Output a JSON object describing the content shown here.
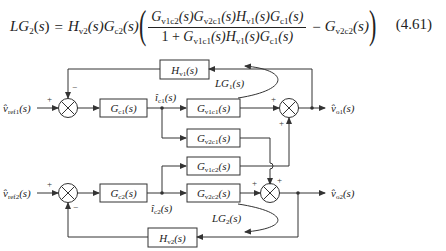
{
  "equation": {
    "number": "(4.61)",
    "lhs": "LG2(s)",
    "lhs_base": "LG",
    "lhs_sub": "2",
    "prefix": [
      {
        "base": "H",
        "sub": "v2",
        "arg": "(s)"
      },
      {
        "base": "G",
        "sub": "c2",
        "arg": "(s)"
      }
    ],
    "numerator": [
      {
        "base": "G",
        "sub": "v1c2",
        "arg": "(s)"
      },
      {
        "base": "G",
        "sub": "v2c1",
        "arg": "(s)"
      },
      {
        "base": "H",
        "sub": "v1",
        "arg": "(s)"
      },
      {
        "base": "G",
        "sub": "c1",
        "arg": "(s)"
      }
    ],
    "denominator_prefix": "1 + ",
    "denominator": [
      {
        "base": "G",
        "sub": "v1c1",
        "arg": "(s)"
      },
      {
        "base": "H",
        "sub": "v1",
        "arg": "(s)"
      },
      {
        "base": "G",
        "sub": "c1",
        "arg": "(s)"
      }
    ],
    "minus_term": {
      "base": "G",
      "sub": "v2c2",
      "arg": "(s)"
    },
    "equals": "=",
    "minus": "−"
  },
  "diagram": {
    "blocks": {
      "Hv1": {
        "base": "H",
        "sub": "v1",
        "arg": "(s)"
      },
      "Gc1": {
        "base": "G",
        "sub": "c1",
        "arg": "(s)"
      },
      "Gv1c1": {
        "base": "G",
        "sub": "v1c1",
        "arg": "(s)"
      },
      "Gv2c1": {
        "base": "G",
        "sub": "v2c1",
        "arg": "(s)"
      },
      "Gv1c2": {
        "base": "G",
        "sub": "v1c2",
        "arg": "(s)"
      },
      "Gv2c2": {
        "base": "G",
        "sub": "v2c2",
        "arg": "(s)"
      },
      "Gc2": {
        "base": "G",
        "sub": "c2",
        "arg": "(s)"
      },
      "Hv2": {
        "base": "H",
        "sub": "v2",
        "arg": "(s)"
      }
    },
    "signals": {
      "vref1": {
        "base": "v̂",
        "sub": "ref1",
        "arg": "(s)"
      },
      "vref2": {
        "base": "v̂",
        "sub": "ref2",
        "arg": "(s)"
      },
      "ic1": {
        "base": "î",
        "sub": "c1",
        "arg": "(s)"
      },
      "ic2": {
        "base": "î",
        "sub": "c2",
        "arg": "(s)"
      },
      "vo1": {
        "base": "v̂",
        "sub": "o1",
        "arg": "(s)"
      },
      "vo2": {
        "base": "v̂",
        "sub": "o2",
        "arg": "(s)"
      }
    },
    "loop_labels": {
      "LG1": {
        "base": "LG",
        "sub": "1",
        "arg": "(s)"
      },
      "LG2": {
        "base": "LG",
        "sub": "2",
        "arg": "(s)"
      }
    },
    "signs": {
      "plus": "+",
      "minus": "−"
    },
    "colors": {
      "line": "#333333",
      "text": "#222222",
      "background": "#ffffff"
    }
  }
}
